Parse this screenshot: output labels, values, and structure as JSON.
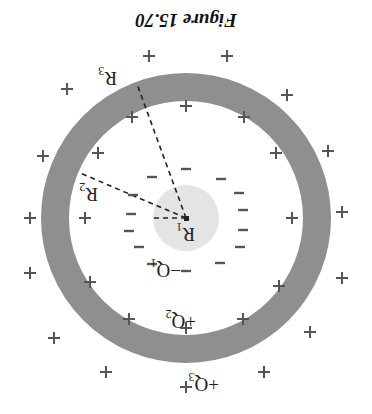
{
  "figure": {
    "caption": "Figure 15.70",
    "orientation": "rotated 180 degrees",
    "colors": {
      "shell": "#8f8f8f",
      "inner_sphere": "#e4e4e4",
      "sign": "#555555",
      "dash_line": "#222222"
    },
    "labels": {
      "r1": "R",
      "r1_sub": "1",
      "r2": "R",
      "r2_sub": "2",
      "r3": "R",
      "r3_sub": "3",
      "q1": "−Q",
      "q1_sub": "1",
      "q2": "+Q",
      "q2_sub": "2",
      "q3": "+Q",
      "q3_sub": "3"
    },
    "signs": {
      "plus": "+",
      "minus": "−"
    }
  }
}
